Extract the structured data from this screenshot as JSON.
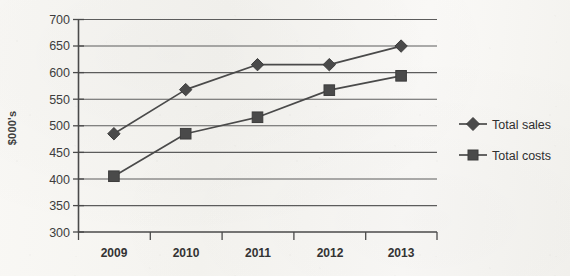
{
  "chart_data": {
    "type": "line",
    "title": "",
    "xlabel": "",
    "ylabel": "$000's",
    "categories": [
      "2009",
      "2010",
      "2011",
      "2012",
      "2013"
    ],
    "ylim": [
      300,
      700
    ],
    "ytick_step": 50,
    "yticks": [
      "700",
      "650",
      "600",
      "550",
      "500",
      "450",
      "400",
      "350",
      "300"
    ],
    "grid": true,
    "legend_position": "right",
    "series": [
      {
        "name": "Total sales",
        "marker": "diamond",
        "color": "#4a4a4a",
        "values": [
          485,
          568,
          615,
          615,
          650
        ]
      },
      {
        "name": "Total costs",
        "marker": "square",
        "color": "#4a4a4a",
        "values": [
          405,
          485,
          516,
          567,
          594
        ]
      }
    ]
  },
  "legend": {
    "items": [
      {
        "label": "Total sales",
        "marker": "diamond-marker-icon"
      },
      {
        "label": "Total costs",
        "marker": "square-marker-icon"
      }
    ]
  },
  "colors": {
    "ink": "#4a4a4a",
    "axis": "#5a5a5a",
    "grid": "#5c5c5c",
    "paper": "#f7f6f3"
  }
}
